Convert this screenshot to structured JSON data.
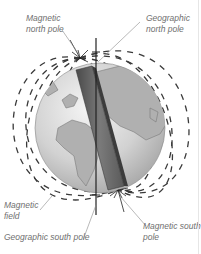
{
  "diagram": {
    "labels": {
      "magnetic_north_pole": [
        "Magnetic",
        "north pole"
      ],
      "geographic_north_pole": [
        "Geographic",
        "north pole"
      ],
      "magnetic_field": [
        "Magnetic",
        "field"
      ],
      "geographic_south_pole": [
        "Geographic south pole"
      ],
      "magnetic_south_pole": [
        "Magnetic south",
        "pole"
      ]
    },
    "colors": {
      "ocean": "#d4d4d4",
      "land": "#b0b0b0",
      "bar_magnet": "#6a6a6a",
      "field_lines": "#3a3a3a",
      "label_text": "#6f6f6f"
    }
  }
}
